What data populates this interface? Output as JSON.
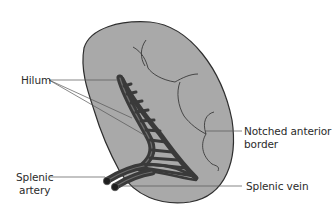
{
  "figure": {
    "colors": {
      "organ_fill": "#a9a9a9",
      "organ_outline": "#2e2e2e",
      "vessel_fill": "#3a3a3a",
      "vessel_highlight": "#6e6e6e",
      "leader_line": "#555555",
      "label_text": "#2b2b2b"
    }
  },
  "labels": {
    "hilum": "Hilum",
    "notched_border_line1": "Notched anterior",
    "notched_border_line2": "border",
    "splenic_artery_line1": "Splenic",
    "splenic_artery_line2": "artery",
    "splenic_vein": "Splenic vein"
  }
}
